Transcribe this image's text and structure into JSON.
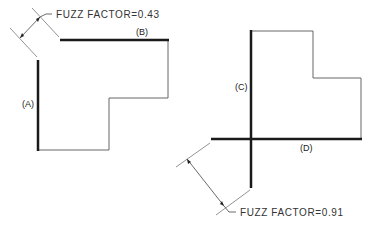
{
  "diagram": {
    "left_figure": {
      "fuzz_label": "FUZZ FACTOR=0.43",
      "edges": [
        {
          "id": "A",
          "label": "(A)",
          "bold": true
        },
        {
          "id": "B",
          "label": "(B)",
          "bold": true
        }
      ]
    },
    "right_figure": {
      "fuzz_label": "FUZZ FACTOR=0.91",
      "edges": [
        {
          "id": "C",
          "label": "(C)",
          "bold": true
        },
        {
          "id": "D",
          "label": "(D)",
          "bold": true
        }
      ]
    },
    "colors": {
      "bold_line": "#1a1a1a",
      "thin_line": "#555555",
      "dim_line": "#444444",
      "background": "#ffffff"
    }
  }
}
